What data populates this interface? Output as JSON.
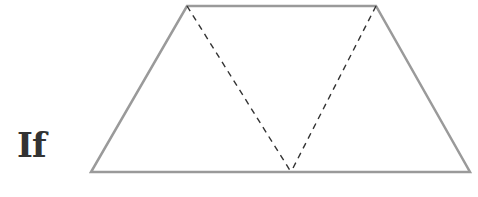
{
  "label": {
    "text": "If"
  },
  "diagram": {
    "shape": "trapezoid",
    "outline_color": "#9a9a9a",
    "dash_color": "#333333",
    "vertices": {
      "top_left": [
        187,
        6
      ],
      "top_right": [
        376,
        6
      ],
      "bottom_right": [
        470,
        172
      ],
      "bottom_left": [
        91,
        172
      ]
    },
    "dashed_lines": [
      {
        "from": "top_left",
        "to": [
          291,
          172
        ]
      },
      {
        "from": "top_right",
        "to": [
          291,
          172
        ]
      }
    ]
  }
}
